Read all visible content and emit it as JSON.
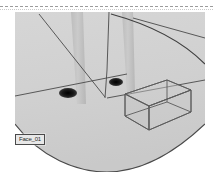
{
  "window": {
    "title": "3D Viewport"
  },
  "divider": {
    "style": "dashed"
  },
  "viewport": {
    "name": "perspective-viewport",
    "background_color": "#d2d2d2",
    "ground_color": "#d0d0d0",
    "outline_color": "#4a4a4a",
    "post_color": "#c0c0c0",
    "shadow_color": "#141414",
    "wireframe_color": "#5a5a5a"
  },
  "selection": {
    "label": "Face_01",
    "label_background": "#e8e8e8",
    "label_border": "#4a4a4a",
    "label_text_color": "#2a2a2a"
  },
  "objects": {
    "posts": [
      {
        "name": "post-left",
        "shadow_x": 68,
        "shadow_y": 93
      },
      {
        "name": "post-right",
        "shadow_x": 116,
        "shadow_y": 82
      }
    ],
    "box": {
      "name": "wireframe-cuboid"
    },
    "horizon": {
      "name": "horizon-arc"
    },
    "construction_lines": 4
  }
}
